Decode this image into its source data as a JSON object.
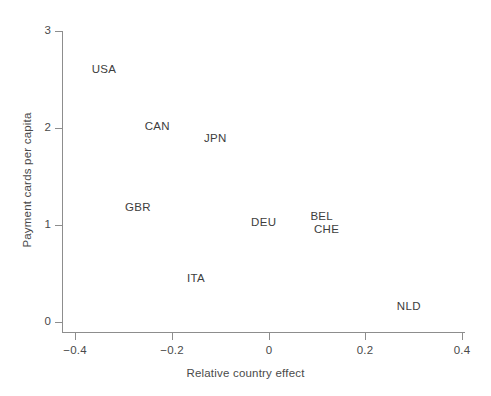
{
  "chart_data": {
    "type": "scatter",
    "title": "",
    "subtitle": "",
    "xlabel": "Relative country effect",
    "ylabel": "Payment cards per capita",
    "xlim": [
      -0.44,
      0.42
    ],
    "ylim": [
      -0.1,
      3.1
    ],
    "xticks": [
      -0.4,
      -0.2,
      0,
      0.2,
      0.4
    ],
    "xticklabels": [
      "−0.4",
      "−0.2",
      "0",
      "0.2",
      "0.4"
    ],
    "yticks": [
      0,
      1,
      2,
      3
    ],
    "yticklabels": [
      "0",
      "1",
      "2",
      "3"
    ],
    "grid": false,
    "legend": false,
    "marker": "text-label-only",
    "points": [
      {
        "label": "USA",
        "x": -0.34,
        "y": 2.61
      },
      {
        "label": "CAN",
        "x": -0.23,
        "y": 2.02
      },
      {
        "label": "JPN",
        "x": -0.11,
        "y": 1.9
      },
      {
        "label": "GBR",
        "x": -0.27,
        "y": 1.19
      },
      {
        "label": "ITA",
        "x": -0.15,
        "y": 0.45
      },
      {
        "label": "DEU",
        "x": -0.01,
        "y": 1.03
      },
      {
        "label": "BEL",
        "x": 0.11,
        "y": 1.09
      },
      {
        "label": "CHE",
        "x": 0.12,
        "y": 0.96
      },
      {
        "label": "NLD",
        "x": 0.29,
        "y": 0.17
      }
    ]
  },
  "figure": {
    "background_color": "#ffffff",
    "axis_color": "#8d8d8d",
    "text_color": "#3d3d3d"
  }
}
